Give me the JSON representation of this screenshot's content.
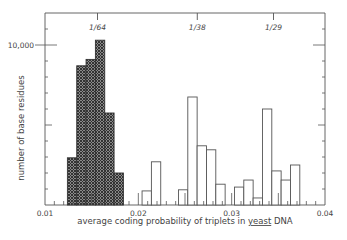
{
  "chart_data": {
    "type": "bar",
    "title": "",
    "xlabel": "average coding probability of triplets in yeast DNA",
    "xlabel_underlined_word": "yeast",
    "ylabel": "number of base residues",
    "xlim": [
      0.01,
      0.04
    ],
    "ylim": [
      0,
      12000
    ],
    "x_ticks": [
      {
        "value": 0.01,
        "label": "0.01"
      },
      {
        "value": 0.02,
        "label": "0.02"
      },
      {
        "value": 0.03,
        "label": "0.03"
      },
      {
        "value": 0.04,
        "label": "0.04"
      }
    ],
    "y_ticks": [
      {
        "value": 10000,
        "label": "10,000"
      }
    ],
    "top_markers": [
      {
        "value": 0.015625,
        "label": "1/64"
      },
      {
        "value": 0.026316,
        "label": "1/38"
      },
      {
        "value": 0.034483,
        "label": "1/29"
      }
    ],
    "grid": false,
    "bin_width": 0.001,
    "series": [
      {
        "name": "hatched (coding)",
        "style": "crosshatch",
        "bins": [
          {
            "x0": 0.0124,
            "x1": 0.0134,
            "value": 2950
          },
          {
            "x0": 0.0134,
            "x1": 0.0144,
            "value": 8700
          },
          {
            "x0": 0.0144,
            "x1": 0.0154,
            "value": 9100
          },
          {
            "x0": 0.0154,
            "x1": 0.0164,
            "value": 10300
          },
          {
            "x0": 0.0164,
            "x1": 0.0174,
            "value": 5750
          },
          {
            "x0": 0.0174,
            "x1": 0.0184,
            "value": 2000
          }
        ]
      },
      {
        "name": "open (non-coding)",
        "style": "outline",
        "bins": [
          {
            "x0": 0.0204,
            "x1": 0.0214,
            "value": 880
          },
          {
            "x0": 0.0214,
            "x1": 0.0224,
            "value": 2700
          },
          {
            "x0": 0.0243,
            "x1": 0.0253,
            "value": 950
          },
          {
            "x0": 0.0253,
            "x1": 0.0263,
            "value": 6750
          },
          {
            "x0": 0.0263,
            "x1": 0.0273,
            "value": 3700
          },
          {
            "x0": 0.0273,
            "x1": 0.0283,
            "value": 3450
          },
          {
            "x0": 0.0283,
            "x1": 0.0293,
            "value": 1300
          },
          {
            "x0": 0.0303,
            "x1": 0.0313,
            "value": 1120
          },
          {
            "x0": 0.0313,
            "x1": 0.0323,
            "value": 1560
          },
          {
            "x0": 0.0323,
            "x1": 0.0333,
            "value": 440
          },
          {
            "x0": 0.0333,
            "x1": 0.0343,
            "value": 6000
          },
          {
            "x0": 0.0343,
            "x1": 0.0353,
            "value": 2130
          },
          {
            "x0": 0.0353,
            "x1": 0.0363,
            "value": 1560
          },
          {
            "x0": 0.0363,
            "x1": 0.0373,
            "value": 2500
          }
        ]
      }
    ]
  }
}
